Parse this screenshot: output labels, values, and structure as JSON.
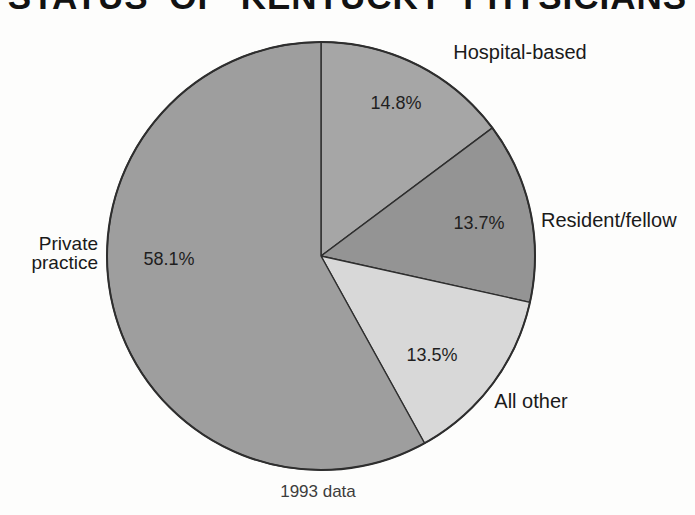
{
  "title": "STATUS OF KENTUCKY PHYSICIANS",
  "caption": "1993 data",
  "chart_data": {
    "type": "pie",
    "title": "STATUS OF KENTUCKY PHYSICIANS",
    "note": "1993 data",
    "start": "12-o-clock",
    "direction": "clockwise",
    "outline_color": "#2e2e2e",
    "background_color": "#fdfdfc",
    "geometry": {
      "cx": 321,
      "cy": 256,
      "r": 214
    },
    "slices": [
      {
        "label": "Hospital-based",
        "value": 14.8,
        "display": "14.8%",
        "color": "#a6a6a6"
      },
      {
        "label": "Resident/fellow",
        "value": 13.7,
        "display": "13.7%",
        "color": "#949494"
      },
      {
        "label": "All other",
        "value": 13.5,
        "display": "13.5%",
        "color": "#d8d8d8"
      },
      {
        "label": "Private practice",
        "value": 58.1,
        "display": "58.1%",
        "color": "#9e9e9e"
      }
    ]
  }
}
